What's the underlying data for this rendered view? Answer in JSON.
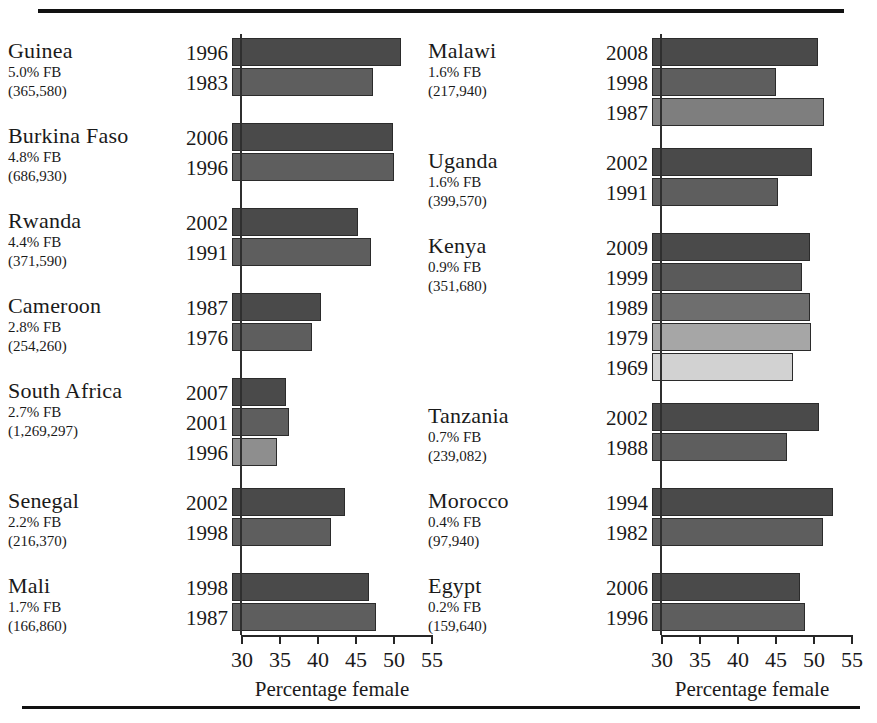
{
  "figure": {
    "axis_title": "Percentage female",
    "tick_labels": [
      "30",
      "35",
      "40",
      "45",
      "50",
      "55"
    ],
    "axis_min": 30,
    "axis_max": 55,
    "fb_suffix": "% FB"
  },
  "chart_data": {
    "type": "bar",
    "title": "",
    "xlabel": "Percentage female",
    "ylabel": "",
    "xlim": [
      30,
      55
    ],
    "xticks": [
      30,
      35,
      40,
      45,
      50,
      55
    ],
    "grid": false,
    "orientation": "horizontal",
    "legend": "none",
    "panels": [
      {
        "name": "left",
        "groups": [
          {
            "country": "Guinea",
            "fb_pct": "5.0% FB",
            "count": "(365,580)",
            "years": [
              "1996",
              "1983"
            ],
            "values": [
              51.0,
              47.4
            ],
            "shades": [
              "#4a4a4a",
              "#5e5e5e"
            ]
          },
          {
            "country": "Burkina Faso",
            "fb_pct": "4.8% FB",
            "count": "(686,930)",
            "years": [
              "2006",
              "1996"
            ],
            "values": [
              50.0,
              50.1
            ],
            "shades": [
              "#4a4a4a",
              "#5e5e5e"
            ]
          },
          {
            "country": "Rwanda",
            "fb_pct": "4.4% FB",
            "count": "(371,590)",
            "years": [
              "2002",
              "1991"
            ],
            "values": [
              45.4,
              47.1
            ],
            "shades": [
              "#4a4a4a",
              "#5e5e5e"
            ]
          },
          {
            "country": "Cameroon",
            "fb_pct": "2.8% FB",
            "count": "(254,260)",
            "years": [
              "1987",
              "1976"
            ],
            "values": [
              40.5,
              39.4
            ],
            "shades": [
              "#4a4a4a",
              "#5e5e5e"
            ]
          },
          {
            "country": "South Africa",
            "fb_pct": "2.7% FB",
            "count": "(1,269,297)",
            "years": [
              "2007",
              "2001",
              "1996"
            ],
            "values": [
              35.9,
              36.3,
              34.7
            ],
            "shades": [
              "#4a4a4a",
              "#5e5e5e",
              "#8e8e8e"
            ]
          },
          {
            "country": "Senegal",
            "fb_pct": "2.2% FB",
            "count": "(216,370)",
            "years": [
              "2002",
              "1998"
            ],
            "values": [
              43.7,
              41.8
            ],
            "shades": [
              "#4a4a4a",
              "#5e5e5e"
            ]
          },
          {
            "country": "Mali",
            "fb_pct": "1.7% FB",
            "count": "(166,860)",
            "years": [
              "1998",
              "1987"
            ],
            "values": [
              46.8,
              47.8
            ],
            "shades": [
              "#4a4a4a",
              "#5e5e5e"
            ]
          }
        ]
      },
      {
        "name": "right",
        "groups": [
          {
            "country": "Malawi",
            "fb_pct": "1.6% FB",
            "count": "(217,940)",
            "years": [
              "2008",
              "1998",
              "1987"
            ],
            "values": [
              50.7,
              45.1,
              51.4
            ],
            "shades": [
              "#4a4a4a",
              "#5e5e5e",
              "#7e7e7e"
            ]
          },
          {
            "country": "Uganda",
            "fb_pct": "1.6% FB",
            "count": "(399,570)",
            "years": [
              "2002",
              "1991"
            ],
            "values": [
              49.9,
              45.4
            ],
            "shades": [
              "#4a4a4a",
              "#5e5e5e"
            ]
          },
          {
            "country": "Kenya",
            "fb_pct": "0.9% FB",
            "count": "(351,680)",
            "years": [
              "2009",
              "1999",
              "1989",
              "1979",
              "1969"
            ],
            "values": [
              49.6,
              48.6,
              49.6,
              49.7,
              47.4
            ],
            "shades": [
              "#4a4a4a",
              "#5a5a5a",
              "#6e6e6e",
              "#a6a6a6",
              "#d2d2d2"
            ]
          },
          {
            "country": "Tanzania",
            "fb_pct": "0.7% FB",
            "count": "(239,082)",
            "years": [
              "2002",
              "1988"
            ],
            "values": [
              50.8,
              46.6
            ],
            "shades": [
              "#4a4a4a",
              "#5e5e5e"
            ]
          },
          {
            "country": "Morocco",
            "fb_pct": "0.4% FB",
            "count": "(97,940)",
            "years": [
              "1994",
              "1982"
            ],
            "values": [
              52.6,
              51.3
            ],
            "shades": [
              "#4a4a4a",
              "#5e5e5e"
            ]
          },
          {
            "country": "Egypt",
            "fb_pct": "0.2% FB",
            "count": "(159,640)",
            "years": [
              "2006",
              "1996"
            ],
            "values": [
              48.3,
              48.9
            ],
            "shades": [
              "#4a4a4a",
              "#5e5e5e"
            ]
          }
        ]
      }
    ]
  }
}
